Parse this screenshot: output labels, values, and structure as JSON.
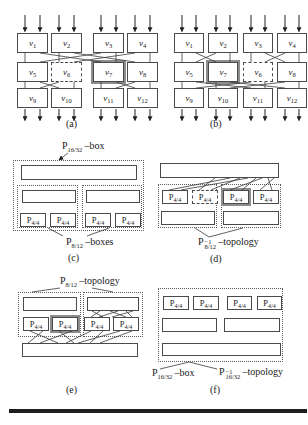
{
  "shared": {
    "node_base": "v",
    "p44": {
      "base": "P",
      "sub": "4/4"
    }
  },
  "panel_a": {
    "caption": "(a)",
    "rows": [
      [
        "1",
        "2",
        "3",
        "4"
      ],
      [
        "5",
        "6",
        "7",
        "8"
      ],
      [
        "9",
        "10",
        "11",
        "12"
      ]
    ]
  },
  "panel_b": {
    "caption": "(b)",
    "rows": [
      [
        "1",
        "2",
        "3",
        "4"
      ],
      [
        "5",
        "7",
        "6",
        "8"
      ],
      [
        "9",
        "10",
        "11",
        "12"
      ]
    ]
  },
  "panel_c": {
    "caption": "(c)",
    "box_label": {
      "base": "P",
      "sub": "16/32",
      "suffix": "–box"
    },
    "sub_label": {
      "base": "P",
      "sub": "8/12",
      "suffix": "–boxes"
    }
  },
  "panel_d": {
    "caption": "(d)",
    "label": {
      "base": "P",
      "sup": "−1",
      "sub": "8/12",
      "suffix": "–topology"
    }
  },
  "panel_e": {
    "caption": "(e)",
    "label": {
      "base": "P",
      "sub": "8/12",
      "suffix": "–topology"
    }
  },
  "panel_f": {
    "caption": "(f)",
    "label_left": {
      "base": "P",
      "sub": "16/32",
      "suffix": "–box"
    },
    "label_right": {
      "base": "P",
      "sup": "−1",
      "sub": "16/32",
      "suffix": "–topology"
    }
  },
  "colors": {
    "ink": "#3a3a3a",
    "border": "#4a4a4a",
    "emphasis_ring": "#8d8d8d"
  }
}
